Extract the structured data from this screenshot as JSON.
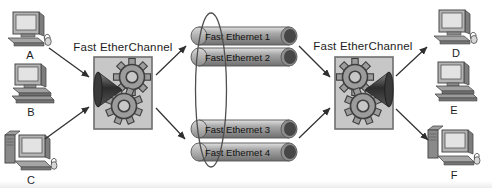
{
  "diagram": {
    "type": "network-topology",
    "channel_labels": {
      "left": "Fast EtherChannel",
      "right": "Fast EtherChannel"
    },
    "hosts": {
      "a": "A",
      "b": "B",
      "c": "C",
      "d": "D",
      "e": "E",
      "f": "F"
    },
    "links": [
      "Fast Ethernet 1",
      "Fast Ethernet 2",
      "Fast Ethernet 3",
      "Fast Ethernet 4"
    ],
    "icons": {
      "switch": "gears-funnel-switch-icon",
      "host_a": "desktop-computer-with-mouse-icon",
      "host_b": "desktop-computer-on-base-icon",
      "host_c": "tower-workstation-icon",
      "host_d": "desktop-computer-with-mouse-icon",
      "host_e": "desktop-computer-on-base-icon",
      "host_f": "tower-workstation-icon",
      "link": "ethernet-pipe-icon",
      "bundle": "channel-bundle-ellipse"
    },
    "colors": {
      "background": "#ffffff",
      "switch_box_fill": "#c7c7c7",
      "switch_box_border": "#6e6e6e",
      "pipe_body": "#9a9a9a",
      "arrow": "#2f2f2f",
      "label_text": "#1c1c1c"
    }
  }
}
